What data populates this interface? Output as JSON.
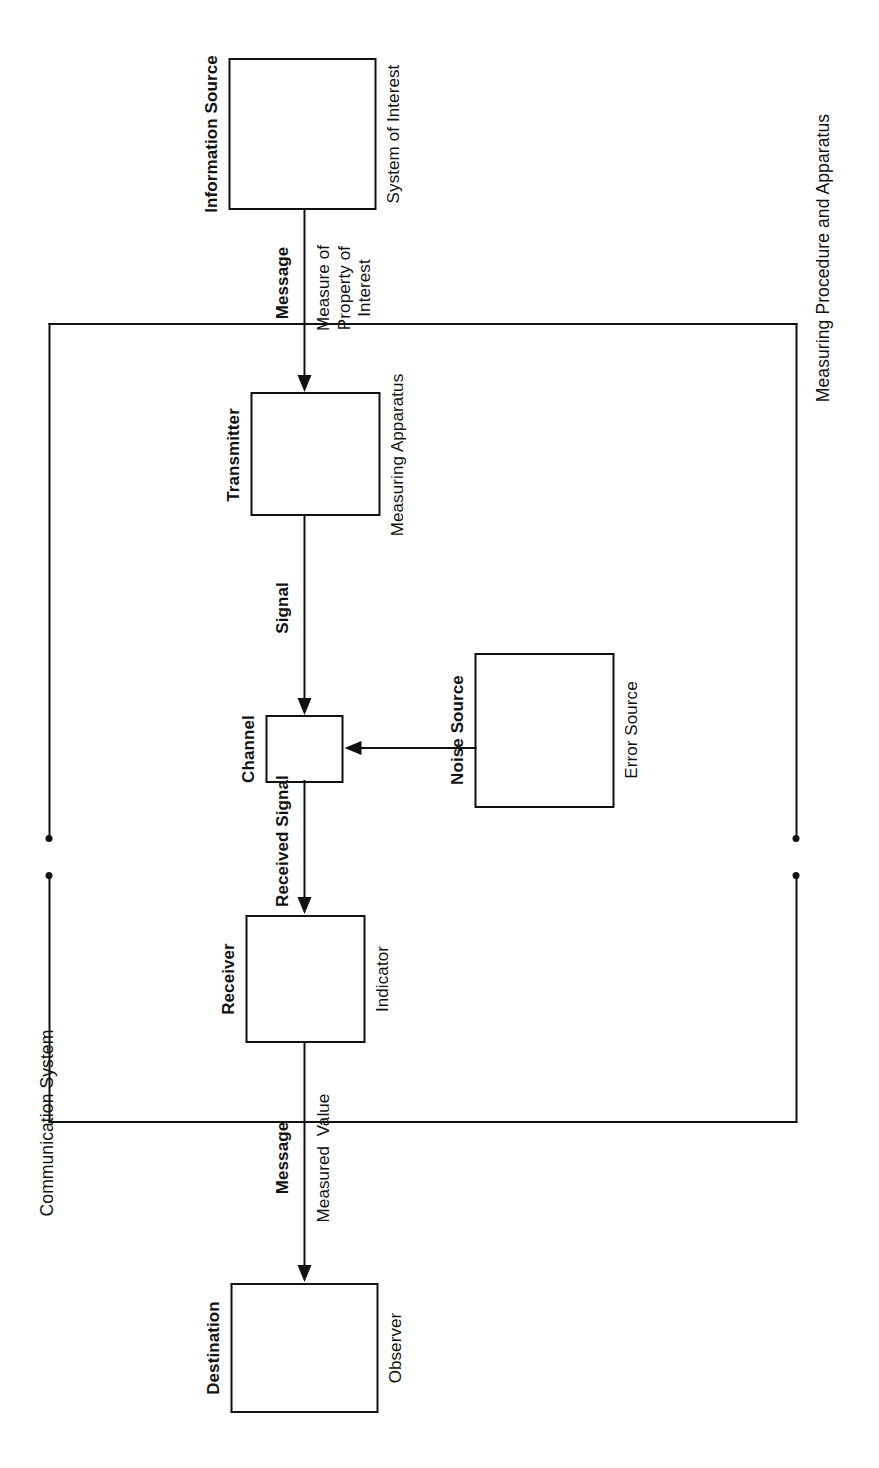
{
  "diagram": {
    "orientation": "rotated-90-ccw",
    "groups": [
      {
        "id": "communication-system",
        "label": "Communication System"
      },
      {
        "id": "measuring-procedure-and-apparatus",
        "label": "Measuring Procedure and Apparatus"
      }
    ],
    "nodes": [
      {
        "id": "information-source",
        "primary_label": "Information Source",
        "secondary_label": "System of Interest"
      },
      {
        "id": "transmitter",
        "primary_label": "Transmitter",
        "secondary_label": "Measuring Apparatus"
      },
      {
        "id": "channel",
        "primary_label": "Channel",
        "secondary_label": ""
      },
      {
        "id": "receiver",
        "primary_label": "Receiver",
        "secondary_label": "Indicator"
      },
      {
        "id": "destination",
        "primary_label": "Destination",
        "secondary_label": "Observer"
      },
      {
        "id": "noise-source",
        "primary_label": "Noise Source",
        "secondary_label": "Error Source"
      }
    ],
    "edges": [
      {
        "id": "source-to-transmitter",
        "from": "information-source",
        "to": "transmitter",
        "primary_label": "Message",
        "secondary_label": "Measure of\nProperty of\nInterest"
      },
      {
        "id": "transmitter-to-channel",
        "from": "transmitter",
        "to": "channel",
        "primary_label": "Signal",
        "secondary_label": ""
      },
      {
        "id": "channel-to-receiver",
        "from": "channel",
        "to": "receiver",
        "primary_label": "Received Signal",
        "secondary_label": ""
      },
      {
        "id": "receiver-to-destination",
        "from": "receiver",
        "to": "destination",
        "primary_label": "Message",
        "secondary_label": "Measured  Value"
      },
      {
        "id": "noise-to-channel",
        "from": "noise-source",
        "to": "channel",
        "primary_label": "",
        "secondary_label": ""
      }
    ],
    "colors": {
      "stroke": "#111111",
      "background": "#ffffff",
      "text": "#111111"
    }
  }
}
